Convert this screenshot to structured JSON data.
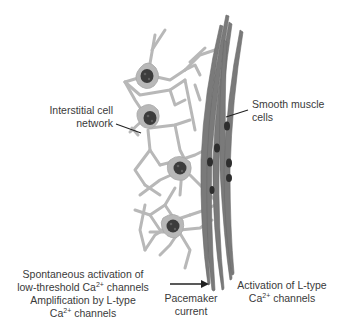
{
  "figure": {
    "colors": {
      "interstitial_cell": "#b8b8b8",
      "interstitial_outline": "#a0a0a0",
      "nucleus": "#3c3c3c",
      "smooth_muscle": "#7a7a7a",
      "smooth_muscle_nucleus": "#2e2e2e",
      "leader_line": "#222222",
      "text": "#3a3a3a",
      "arrow": "#222222"
    },
    "labels": {
      "interstitial": {
        "line1": "Interstitial cell",
        "line2": "network"
      },
      "smooth_muscle": {
        "line1": "Smooth muscle",
        "line2": "cells"
      }
    },
    "captions": {
      "left": {
        "line1": "Spontaneous activation of",
        "line2_prefix": "low-threshold Ca",
        "line2_sup": "2+",
        "line2_suffix": " channels",
        "line3": "Amplification by L-type",
        "line4_prefix": "Ca",
        "line4_sup": "2+",
        "line4_suffix": " channels"
      },
      "middle": {
        "line1": "Pacemaker",
        "line2": "current"
      },
      "right": {
        "line1": "Activation of L-type",
        "line2_prefix": "Ca",
        "line2_sup": "2+",
        "line2_suffix": " channels"
      }
    }
  }
}
